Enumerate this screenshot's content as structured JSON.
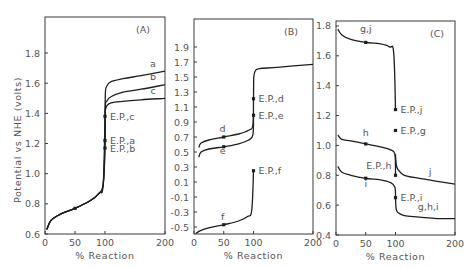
{
  "figure": {
    "ylabel": "Potential vs NHE (volts)",
    "xlabel": "% Reaction"
  },
  "chart_data": [
    {
      "type": "line",
      "panel": "(A)",
      "xlabel": "% Reaction",
      "ylabel": "Potential vs NHE (volts)",
      "xlim": [
        0,
        200
      ],
      "ylim": [
        0.6,
        2.0
      ],
      "xticks": [
        0,
        50,
        100,
        200
      ],
      "yticks": [
        0.6,
        0.8,
        1.0,
        1.2,
        1.4,
        1.6,
        1.8
      ],
      "grid": false,
      "series": [
        {
          "name": "a",
          "x": [
            3,
            10,
            25,
            50,
            75,
            90,
            97,
            100,
            100.5,
            103,
            110,
            130,
            160,
            200
          ],
          "y": [
            0.63,
            0.69,
            0.73,
            0.77,
            0.82,
            0.87,
            0.93,
            1.22,
            1.52,
            1.58,
            1.61,
            1.63,
            1.65,
            1.68
          ]
        },
        {
          "name": "b",
          "x": [
            3,
            10,
            25,
            50,
            75,
            90,
            97,
            100,
            100.5,
            103,
            110,
            130,
            160,
            200
          ],
          "y": [
            0.63,
            0.69,
            0.73,
            0.77,
            0.82,
            0.87,
            0.93,
            1.17,
            1.44,
            1.48,
            1.51,
            1.54,
            1.56,
            1.59
          ]
        },
        {
          "name": "c",
          "x": [
            3,
            10,
            25,
            50,
            75,
            90,
            97,
            100,
            100.5,
            103,
            110,
            130,
            160,
            200
          ],
          "y": [
            0.63,
            0.69,
            0.73,
            0.77,
            0.82,
            0.87,
            0.93,
            1.38,
            1.42,
            1.45,
            1.47,
            1.48,
            1.49,
            1.5
          ]
        }
      ],
      "markers": [
        {
          "x": 50,
          "y": 0.77,
          "label": ""
        },
        {
          "x": 100,
          "y": 1.38,
          "label": "E.P.,c"
        },
        {
          "x": 100,
          "y": 1.22,
          "label": "E.P.,a"
        },
        {
          "x": 100,
          "y": 1.17,
          "label": "E.P.,b"
        }
      ],
      "curve_labels": [
        {
          "text": "a",
          "x": 180,
          "y": 1.71
        },
        {
          "text": "b",
          "x": 180,
          "y": 1.62
        },
        {
          "text": "c",
          "x": 180,
          "y": 1.53
        }
      ]
    },
    {
      "type": "line",
      "panel": "(B)",
      "xlabel": "% Reaction",
      "xlim": [
        0,
        200
      ],
      "ylim": [
        -0.6,
        2.1
      ],
      "xticks": [
        0,
        50,
        100,
        200
      ],
      "yticks": [
        -0.5,
        -0.3,
        -0.1,
        0.1,
        0.3,
        0.5,
        0.7,
        0.9,
        1.1,
        1.3,
        1.5,
        1.7,
        1.9
      ],
      "grid": false,
      "series": [
        {
          "name": "d",
          "x": [
            8,
            12,
            25,
            50,
            75,
            92,
            99,
            100,
            100.5,
            103,
            110,
            140,
            200
          ],
          "y": [
            0.56,
            0.62,
            0.66,
            0.7,
            0.74,
            0.79,
            0.86,
            1.21,
            1.5,
            1.58,
            1.61,
            1.63,
            1.67
          ]
        },
        {
          "name": "e",
          "x": [
            8,
            12,
            25,
            50,
            75,
            92,
            99,
            100
          ],
          "y": [
            0.43,
            0.5,
            0.54,
            0.57,
            0.61,
            0.66,
            0.73,
            0.99
          ]
        },
        {
          "name": "f",
          "x": [
            3,
            10,
            25,
            50,
            75,
            90,
            97,
            100
          ],
          "y": [
            -0.59,
            -0.55,
            -0.51,
            -0.47,
            -0.42,
            -0.36,
            -0.28,
            0.25
          ]
        }
      ],
      "markers": [
        {
          "x": 50,
          "y": 0.7,
          "label": ""
        },
        {
          "x": 50,
          "y": 0.57,
          "label": ""
        },
        {
          "x": 50,
          "y": -0.47,
          "label": ""
        },
        {
          "x": 100,
          "y": 1.21,
          "label": "E.P.,d"
        },
        {
          "x": 100,
          "y": 0.99,
          "label": "E.P.,e"
        },
        {
          "x": 100,
          "y": 0.25,
          "label": "E.P.,f"
        }
      ],
      "curve_labels": [
        {
          "text": "d",
          "x": 48,
          "y": 0.77
        },
        {
          "text": "e",
          "x": 48,
          "y": 0.48
        },
        {
          "text": "f",
          "x": 48,
          "y": -0.4
        }
      ]
    },
    {
      "type": "line",
      "panel": "(C)",
      "xlabel": "% Reaction",
      "xlim": [
        0,
        200
      ],
      "ylim": [
        0.4,
        1.84
      ],
      "xticks": [
        0,
        50,
        100,
        200
      ],
      "yticks": [
        0.4,
        0.6,
        0.8,
        1.0,
        1.2,
        1.4,
        1.6,
        1.8
      ],
      "grid": false,
      "series": [
        {
          "name": "g,j",
          "x": [
            3,
            10,
            25,
            50,
            75,
            90,
            97,
            100
          ],
          "y": [
            1.78,
            1.74,
            1.71,
            1.69,
            1.68,
            1.66,
            1.62,
            1.24
          ]
        },
        {
          "name": "h",
          "x": [
            3,
            10,
            25,
            50,
            75,
            92,
            99,
            100
          ],
          "y": [
            1.07,
            1.04,
            1.03,
            1.01,
            0.99,
            0.97,
            0.94,
            0.8
          ]
        },
        {
          "name": "i",
          "x": [
            3,
            10,
            25,
            50,
            75,
            92,
            99,
            100
          ],
          "y": [
            0.86,
            0.82,
            0.8,
            0.78,
            0.77,
            0.75,
            0.72,
            0.65
          ]
        },
        {
          "name": "j",
          "x": [
            100,
            101,
            104,
            115,
            140,
            170,
            200
          ],
          "y": [
            0.94,
            0.88,
            0.84,
            0.8,
            0.78,
            0.76,
            0.74
          ]
        },
        {
          "name": "g,h,i",
          "x": [
            100,
            101,
            104,
            115,
            140,
            170,
            200
          ],
          "y": [
            0.65,
            0.58,
            0.55,
            0.53,
            0.52,
            0.51,
            0.51
          ]
        }
      ],
      "markers": [
        {
          "x": 50,
          "y": 1.69,
          "label": ""
        },
        {
          "x": 50,
          "y": 1.01,
          "label": ""
        },
        {
          "x": 50,
          "y": 0.78,
          "label": ""
        },
        {
          "x": 100,
          "y": 1.24,
          "label": "E.P.,j"
        },
        {
          "x": 100,
          "y": 1.1,
          "label": "E.P.,g"
        },
        {
          "x": 100,
          "y": 0.8,
          "label": "E.P.,h"
        },
        {
          "x": 100,
          "y": 0.65,
          "label": "E.P.,i"
        }
      ],
      "curve_labels": [
        {
          "text": "g,j",
          "x": 50,
          "y": 1.76
        },
        {
          "text": "h",
          "x": 50,
          "y": 1.06
        },
        {
          "text": "i",
          "x": 50,
          "y": 0.72
        },
        {
          "text": "j",
          "x": 158,
          "y": 0.8
        },
        {
          "text": "g,h,i",
          "x": 155,
          "y": 0.57
        }
      ]
    }
  ]
}
